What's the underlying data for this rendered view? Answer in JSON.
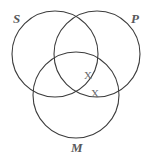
{
  "figure": {
    "type": "venn-diagram",
    "background_color": "#ffffff",
    "stroke_color": "#3c3c3c",
    "label_color": "#58585a",
    "mark_color": "#6b6b6e",
    "width": 151,
    "height": 158
  },
  "circles": [
    {
      "id": "S",
      "label": "S",
      "cx": 55,
      "cy": 54,
      "r": 43
    },
    {
      "id": "P",
      "label": "P",
      "cx": 97,
      "cy": 54,
      "r": 43
    },
    {
      "id": "M",
      "label": "M",
      "cx": 76,
      "cy": 95,
      "r": 43
    }
  ],
  "labels": {
    "s": "S",
    "p": "P",
    "m": "M"
  },
  "marks": [
    {
      "id": "x1",
      "glyph": "X",
      "x": 88,
      "y": 75,
      "region": "S-and-P-and-M"
    },
    {
      "id": "x2",
      "glyph": "X",
      "x": 95,
      "y": 93,
      "region": "P-and-M"
    }
  ],
  "mark_glyphs": {
    "first": "X",
    "second": "X"
  }
}
